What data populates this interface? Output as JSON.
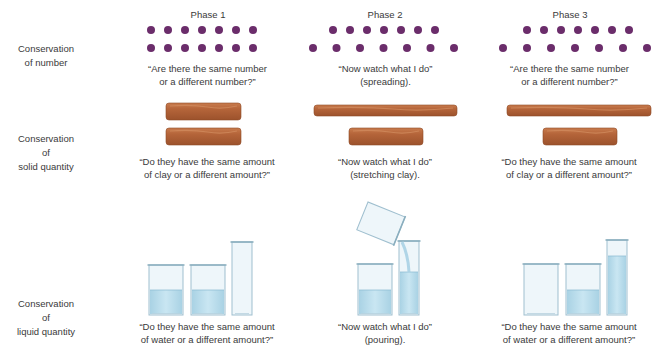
{
  "phases": [
    "Phase 1",
    "Phase 2",
    "Phase 3"
  ],
  "rows": [
    {
      "label": "Conservation\nof number",
      "captions": [
        "“Are there the same number\nor a different number?”",
        "“Now watch what I do”\n(spreading).",
        "“Are there the same number\nor a different number?”"
      ],
      "dots_per_row": 7
    },
    {
      "label": "Conservation\nof\nsolid quantity",
      "captions": [
        "“Do they have the same amount\nof clay or a different amount?”",
        "“Now watch what I do”\n(stretching clay).",
        "“Do they have the same amount\nof clay or a different amount?”"
      ]
    },
    {
      "label": "Conservation\nof\nliquid quantity",
      "captions": [
        "“Do they have the same amount\nof water or a different amount?”",
        "“Now watch what I do”\n(pouring).",
        "“Do they have the same amount\nof water or a different amount?”"
      ]
    }
  ],
  "colors": {
    "dot": "#6b2d6b",
    "clay": "#b5653a",
    "clay_highlight": "#d08a5c",
    "water": "#bfe0ee",
    "glass": "#eef6fa",
    "glass_edge": "#9fbfcf"
  }
}
